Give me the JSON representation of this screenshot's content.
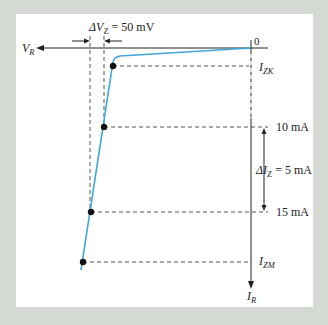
{
  "figure": {
    "type": "zener-diode-reverse-characteristic",
    "background_color": "#d5d9d4",
    "curve_color": "#3ea6d8",
    "axis_color": "#222222"
  },
  "labels": {
    "delta_vz": {
      "prefix": "ΔV",
      "sub": "Z",
      "suffix": " = 50 mV"
    },
    "vr": {
      "main": "V",
      "sub": "R"
    },
    "origin": "0",
    "izk": {
      "main": "I",
      "sub": "ZK"
    },
    "i10": "10 mA",
    "delta_iz": {
      "prefix": "ΔI",
      "sub": "Z",
      "suffix": " = 5 mA"
    },
    "i15": "15 mA",
    "izm": {
      "main": "I",
      "sub": "ZM"
    },
    "ir": {
      "main": "I",
      "sub": "R"
    }
  }
}
